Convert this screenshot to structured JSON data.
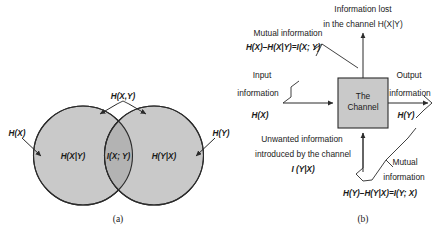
{
  "figure": {
    "background": "#ffffff",
    "ink": "#1a1a1a",
    "venn_fill": "#c9c9c9",
    "overlap_fill": "#b3b3b3",
    "channel_fill": "#c9c9c9"
  },
  "panel_a": {
    "caption": "(a)",
    "top_label": "H(X,Y)",
    "left_outer_label": "H(X)",
    "right_outer_label": "H(Y)",
    "left_region_label": "H(X|Y)",
    "overlap_label": "I(X; Y)",
    "right_region_label": "H(Y|X)"
  },
  "panel_b": {
    "caption": "(b)",
    "channel_box": {
      "line1": "The",
      "line2": "Channel"
    },
    "top": {
      "line1": "Information lost",
      "line2": "in the channel H(X|Y)"
    },
    "upper_left": {
      "line1": "Mutual information",
      "line2": "H(X)–H(X|Y)=I(X; Y)"
    },
    "input": {
      "line1": "Input",
      "line2": "information",
      "line3": "H(X)"
    },
    "output": {
      "line1": "Output",
      "line2": "information",
      "line3": "H(Y)"
    },
    "lower_left": {
      "line1": "Unwanted information",
      "line2": "introduced by the channel",
      "line3": "I (Y|X)"
    },
    "lower_right": {
      "line1": "Mutual",
      "line2": "information",
      "line3": "H(Y)–H(Y|X)=I(Y; X)"
    }
  }
}
